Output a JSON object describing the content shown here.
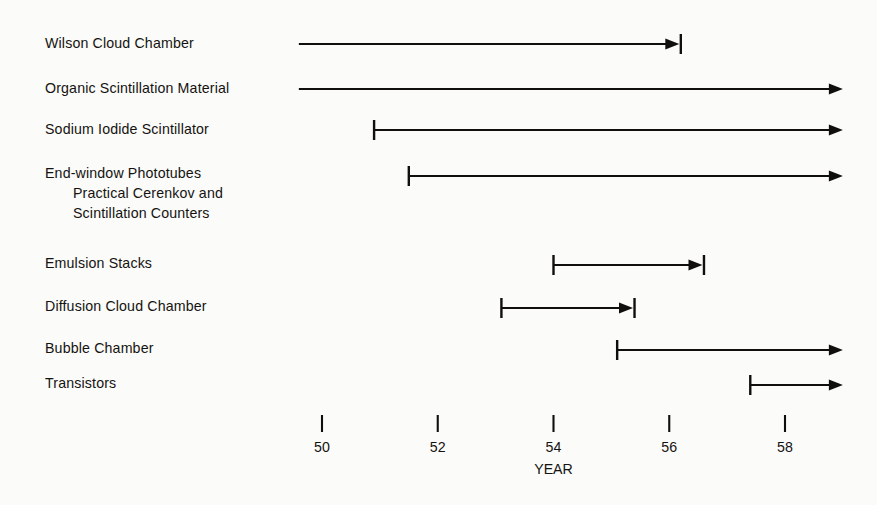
{
  "figure": {
    "background_color": "#fbfbfa",
    "ink_color": "#100f0d"
  },
  "axis": {
    "title": "YEAR",
    "ticks": [
      {
        "label": "50",
        "value": 50
      },
      {
        "label": "52",
        "value": 52
      },
      {
        "label": "54",
        "value": 54
      },
      {
        "label": "56",
        "value": 56
      },
      {
        "label": "58",
        "value": 58
      }
    ]
  },
  "rows": [
    {
      "label_lines": [
        "Wilson Cloud Chamber"
      ]
    },
    {
      "label_lines": [
        "Organic Scintillation Material"
      ]
    },
    {
      "label_lines": [
        "Sodium Iodide Scintillator"
      ]
    },
    {
      "label_lines": [
        "End-window Phototubes",
        "Practical Cerenkov and",
        "Scintillation Counters"
      ]
    },
    {
      "label_lines": [
        "Emulsion Stacks"
      ]
    },
    {
      "label_lines": [
        "Diffusion Cloud Chamber"
      ]
    },
    {
      "label_lines": [
        "Bubble Chamber"
      ]
    },
    {
      "label_lines": [
        "Transistors"
      ]
    }
  ],
  "chart_data": {
    "type": "bar",
    "title": "",
    "xlabel": "YEAR",
    "ylabel": "",
    "xlim": [
      49.6,
      59.0
    ],
    "grid": false,
    "legend": null,
    "orientation": "horizontal",
    "note": "Gantt-style timeline of detector / electronics technologies. Each entry is an interval with a left end (bar = defined start, none = extends past left edge of plotting band) and a right end (bar+arrow = defined end, open arrow = continues past 1959).",
    "categories": [
      "Wilson Cloud Chamber",
      "Organic Scintillation Material",
      "Sodium Iodide Scintillator",
      "End-window Phototubes / Practical Cerenkov and Scintillation Counters",
      "Emulsion Stacks",
      "Diffusion Cloud Chamber",
      "Bubble Chamber",
      "Transistors"
    ],
    "bars": [
      {
        "category": "Wilson Cloud Chamber",
        "start": 49.6,
        "end": 56.2,
        "start_cap": "none",
        "end_cap": "arrow-bar"
      },
      {
        "category": "Organic Scintillation Material",
        "start": 49.6,
        "end": 59.0,
        "start_cap": "none",
        "end_cap": "arrow-open"
      },
      {
        "category": "Sodium Iodide Scintillator",
        "start": 50.9,
        "end": 59.0,
        "start_cap": "bar",
        "end_cap": "arrow-open"
      },
      {
        "category": "End-window Phototubes / Practical Cerenkov and Scintillation Counters",
        "start": 51.5,
        "end": 59.0,
        "start_cap": "bar",
        "end_cap": "arrow-open"
      },
      {
        "category": "Emulsion Stacks",
        "start": 54.0,
        "end": 56.6,
        "start_cap": "bar",
        "end_cap": "arrow-bar"
      },
      {
        "category": "Diffusion Cloud Chamber",
        "start": 53.1,
        "end": 55.4,
        "start_cap": "bar",
        "end_cap": "arrow-bar"
      },
      {
        "category": "Bubble Chamber",
        "start": 55.1,
        "end": 59.0,
        "start_cap": "bar",
        "end_cap": "arrow-open"
      },
      {
        "category": "Transistors",
        "start": 57.4,
        "end": 59.0,
        "start_cap": "bar",
        "end_cap": "arrow-open"
      }
    ]
  }
}
